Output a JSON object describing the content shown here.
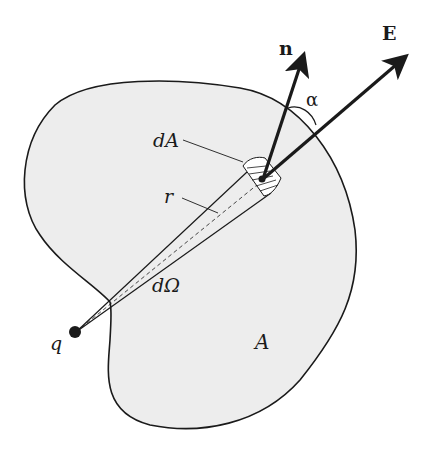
{
  "diagram": {
    "labels": {
      "normal": "n",
      "field": "E",
      "angle": "α",
      "area_element": "dA",
      "radius": "r",
      "solid_angle": "dΩ",
      "surface": "A",
      "charge": "q"
    },
    "colors": {
      "surface_fill": "#ededed",
      "stroke": "#1a1a1a",
      "background": "#ffffff"
    }
  }
}
